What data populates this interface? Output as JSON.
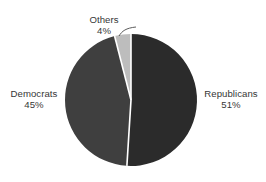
{
  "chart_data": {
    "type": "pie",
    "title": "",
    "subtitle": "",
    "xlabel": "",
    "ylabel": "",
    "legend_position": "none",
    "grid": false,
    "total": 100,
    "units": "percent",
    "categories": [
      "Republicans",
      "Democrats",
      "Others"
    ],
    "values": [
      51,
      45,
      4
    ],
    "colors": [
      "#2b2b2b",
      "#3f3f3f",
      "#bdbdbd"
    ],
    "start_angle_deg": 0,
    "direction": "clockwise",
    "slices": [
      {
        "name": "Republicans",
        "value": 51,
        "value_label": "51%",
        "color": "#2b2b2b",
        "start_angle_deg": 0,
        "end_angle_deg": 183.6,
        "label_position": "outside-right",
        "leader_line": false
      },
      {
        "name": "Democrats",
        "value": 45,
        "value_label": "45%",
        "color": "#3f3f3f",
        "start_angle_deg": 183.6,
        "end_angle_deg": 345.6,
        "label_position": "outside-left",
        "leader_line": false
      },
      {
        "name": "Others",
        "value": 4,
        "value_label": "4%",
        "color": "#bdbdbd",
        "start_angle_deg": 345.6,
        "end_angle_deg": 360.0,
        "label_position": "outside-top",
        "leader_line": true
      }
    ],
    "geometry": {
      "center_x": 131,
      "center_y": 100,
      "radius": 66,
      "separator_color": "#ffffff",
      "separator_width": 1.6
    }
  },
  "labels": {
    "others": {
      "name": "Others",
      "percent": "4%"
    },
    "democrats": {
      "name": "Democrats",
      "percent": "45%"
    },
    "republicans": {
      "name": "Republicans",
      "percent": "51%"
    }
  },
  "background": "#ffffff",
  "text_color": "#363636"
}
